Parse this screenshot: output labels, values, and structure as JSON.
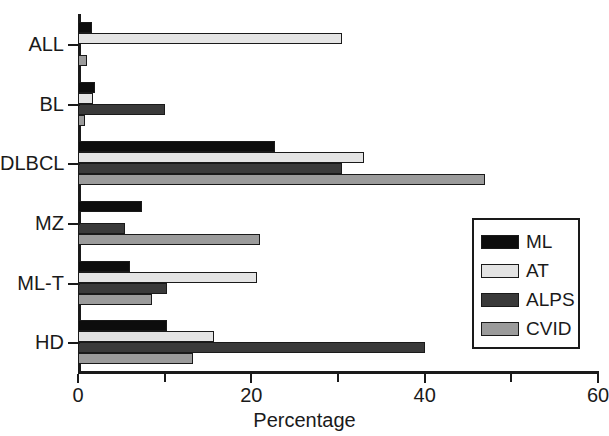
{
  "chart_data": {
    "type": "bar",
    "orientation": "horizontal",
    "title": "",
    "xlabel": "Percentage",
    "ylabel": "",
    "xlim": [
      0,
      60
    ],
    "xticks": [
      0,
      10,
      20,
      30,
      40,
      50,
      60
    ],
    "xtick_labels": [
      "0",
      "",
      "20",
      "",
      "40",
      "",
      "60"
    ],
    "grid": false,
    "legend_position": "center right",
    "categories": [
      "ALL",
      "BL",
      "DLBCL",
      "MZ",
      "ML-T",
      "HD"
    ],
    "series": [
      {
        "name": "ML",
        "color": "#0d0d0d",
        "values": [
          1.6,
          2.0,
          22.7,
          7.4,
          6.0,
          10.3
        ]
      },
      {
        "name": "AT",
        "color": "#e4e4e4",
        "values": [
          30.5,
          1.7,
          33.0,
          0,
          20.6,
          15.7
        ]
      },
      {
        "name": "ALPS",
        "color": "#3a3a3a",
        "values": [
          0,
          10.0,
          30.5,
          5.4,
          10.3,
          40.0
        ]
      },
      {
        "name": "CVID",
        "color": "#9b9b9b",
        "values": [
          1.0,
          0.8,
          47.0,
          21.0,
          8.5,
          13.3
        ]
      }
    ]
  },
  "legend": {
    "entries": [
      {
        "label": "ML"
      },
      {
        "label": "AT"
      },
      {
        "label": "ALPS"
      },
      {
        "label": "CVID"
      }
    ]
  }
}
